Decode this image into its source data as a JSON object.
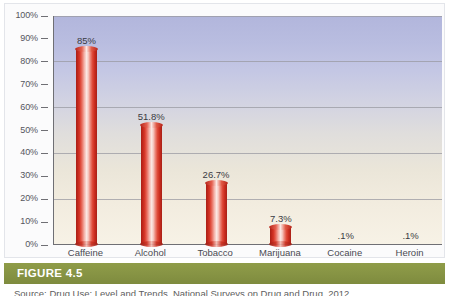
{
  "figure": {
    "banner_label": "FIGURE 4.5",
    "banner_color": "#87943f",
    "source_line": "Source: Drug Use: Level and Trends, National Surveys on Drug and Drug, 2012"
  },
  "chart_data": {
    "type": "bar",
    "title": "",
    "xlabel": "",
    "ylabel": "",
    "categories": [
      "Caffeine",
      "Alcohol",
      "Tobacco",
      "Marijuana",
      "Cocaine",
      "Heroin"
    ],
    "values": [
      85,
      51.8,
      26.7,
      7.3,
      0.1,
      0.1
    ],
    "value_labels": [
      "85%",
      "51.8%",
      "26.7%",
      "7.3%",
      ".1%",
      ".1%"
    ],
    "ylim": [
      0,
      100
    ],
    "ytick_values": [
      0,
      10,
      20,
      30,
      40,
      50,
      60,
      70,
      80,
      90,
      100
    ],
    "ytick_labels": [
      "0%",
      "10%",
      "20%",
      "30%",
      "40%",
      "50%",
      "60%",
      "70%",
      "80%",
      "90%",
      "100%"
    ],
    "gridline_values": [
      20,
      40,
      60,
      80,
      100
    ],
    "grid": true,
    "legend": false,
    "bar_color": "#c3281c",
    "bar_highlight_color": "#fbe6e2",
    "plot_bg_top_color": "#b2b6dc",
    "plot_bg_bottom_color": "#f7f2e6"
  }
}
